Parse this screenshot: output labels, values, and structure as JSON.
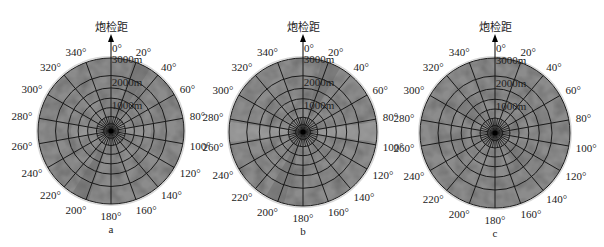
{
  "figure": {
    "panels": [
      {
        "id": "a",
        "letter": "a",
        "title": "炮检距",
        "cx": 111,
        "cy": 131,
        "r": 73
      },
      {
        "id": "b",
        "letter": "b",
        "title": "炮检距",
        "cx": 303,
        "cy": 132,
        "r": 74
      },
      {
        "id": "c",
        "letter": "c",
        "title": "炮检距",
        "cx": 495,
        "cy": 133,
        "r": 75
      }
    ],
    "colors": {
      "disk_fill": "#8c8c8c",
      "disk_dark": "#6e6e6e",
      "disk_light": "#a8a8a8",
      "grid_line": "#1a1a1a",
      "text": "#222222",
      "outer_ring": "#d8d8d8"
    }
  },
  "chart_data": [
    {
      "type": "polar",
      "panel": "a",
      "title": "炮检距",
      "radial_axis_label": "炮检距 (offset)",
      "angular_ticks_deg": [
        0,
        20,
        40,
        60,
        80,
        100,
        120,
        140,
        160,
        180,
        200,
        220,
        240,
        260,
        280,
        300,
        320,
        340
      ],
      "angular_tick_labels": [
        "0°",
        "20°",
        "40°",
        "60°",
        "80°",
        "100°",
        "120°",
        "140°",
        "160°",
        "180°",
        "200°",
        "220°",
        "240°",
        "260°",
        "280°",
        "300°",
        "320°",
        "340°"
      ],
      "radial_tick_labels": [
        "1000m",
        "2000m",
        "3000m"
      ],
      "radial_range_m": [
        0,
        3300
      ],
      "ring_fractions": [
        0.1,
        0.2,
        0.32,
        0.45,
        0.59,
        0.76,
        1.0
      ],
      "spoke_count": 18,
      "notes": "Grayscale offset-azimuth rose diagram; darker wedge bands near 20°-30° and 200°-210°"
    },
    {
      "type": "polar",
      "panel": "b",
      "title": "炮检距",
      "angular_ticks_deg": [
        0,
        20,
        40,
        60,
        80,
        100,
        120,
        140,
        160,
        180,
        200,
        220,
        240,
        260,
        280,
        300,
        320,
        340
      ],
      "angular_tick_labels": [
        "0°",
        "20°",
        "40°",
        "60°",
        "80°",
        "100°",
        "120°",
        "140°",
        "160°",
        "180°",
        "200°",
        "220°",
        "240°",
        "260°",
        "280°",
        "300°",
        "320°",
        "340°"
      ],
      "radial_tick_labels": [
        "1000m",
        "2000m",
        "3000m"
      ],
      "radial_range_m": [
        0,
        3300
      ],
      "ring_fractions": [
        0.1,
        0.2,
        0.32,
        0.45,
        0.59,
        0.76,
        1.0
      ],
      "spoke_count": 18,
      "notes": "Darker bands near 20° and 200°, lighter bands along 90°/270°"
    },
    {
      "type": "polar",
      "panel": "c",
      "title": "炮检距",
      "angular_ticks_deg": [
        0,
        20,
        40,
        60,
        80,
        100,
        120,
        140,
        160,
        180,
        200,
        220,
        240,
        260,
        280,
        300,
        320,
        340
      ],
      "angular_tick_labels": [
        "0°",
        "20°",
        "40°",
        "60°",
        "80°",
        "100°",
        "120°",
        "140°",
        "160°",
        "180°",
        "200°",
        "220°",
        "240°",
        "260°",
        "280°",
        "300°",
        "320°",
        "340°"
      ],
      "radial_tick_labels": [
        "1000m",
        "2000m",
        "3000m"
      ],
      "radial_range_m": [
        0,
        3300
      ],
      "ring_fractions": [
        0.1,
        0.2,
        0.32,
        0.45,
        0.59,
        0.76,
        1.0
      ],
      "spoke_count": 18,
      "notes": "More uniform gray distribution"
    }
  ]
}
